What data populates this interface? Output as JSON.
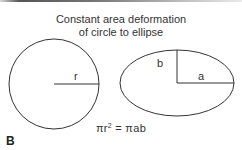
{
  "figure": {
    "title_line1": "Constant area deformation",
    "title_line2": "of circle to ellipse",
    "circle_label": "r",
    "ellipse_label_b": "b",
    "ellipse_label_a": "a",
    "equation_left": "πr",
    "equation_exponent": "2",
    "equation_right": " = πab",
    "panel_label": "B"
  },
  "colors": {
    "stroke": "#333333",
    "text": "#333333"
  }
}
